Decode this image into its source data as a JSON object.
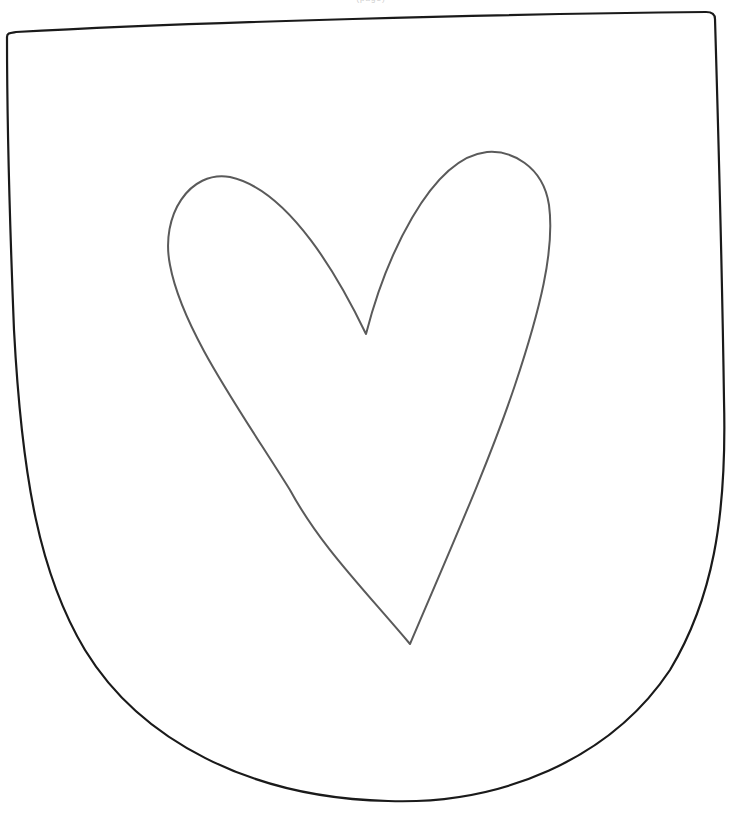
{
  "page": {
    "header_text": "(page)",
    "background": "#ffffff"
  },
  "shield": {
    "shape": "shield-outline",
    "stroke": "#1a1a1a",
    "stroke_width": 2.2
  },
  "heart": {
    "shape": "heart-outline",
    "stroke": "#5a5a5a",
    "stroke_width": 2
  }
}
